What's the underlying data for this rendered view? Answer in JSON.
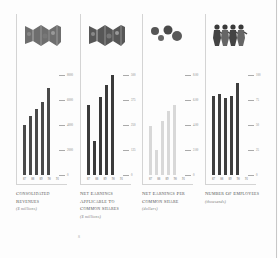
{
  "chart_data": [
    {
      "type": "bar",
      "title": "Consolidated revenues",
      "ylabel": "($ millions)",
      "categories": [
        "'87",
        "'88",
        "'89",
        "'90",
        "'91"
      ],
      "values": [
        4000,
        4700,
        5300,
        5850,
        6950
      ],
      "yticks": [
        0,
        2000,
        4000,
        6000,
        8000
      ],
      "ylim": [
        0,
        8000
      ],
      "bar_color": "#4a4a4a",
      "icon": "folded-map-icon"
    },
    {
      "type": "bar",
      "title": "Net earnings applicable to common shares",
      "ylabel": "($ millions)",
      "categories": [
        "'87",
        "'88",
        "'89",
        "'90",
        "'91"
      ],
      "values": [
        350,
        170,
        390,
        450,
        520
      ],
      "yticks": [
        0,
        125,
        250,
        375,
        500
      ],
      "ylim": [
        0,
        500
      ],
      "bar_color": "#3a3a3a",
      "icon": "folded-map-icon"
    },
    {
      "type": "bar",
      "title": "Net earnings per common share",
      "ylabel": "(dollars)",
      "categories": [
        "'87",
        "'88",
        "'89",
        "'90",
        "'91"
      ],
      "values": [
        3.9,
        2.0,
        4.3,
        5.1,
        5.6
      ],
      "yticks": [
        0,
        2,
        4,
        6,
        8
      ],
      "ylim": [
        0,
        8
      ],
      "bar_color": "#d8d8d8",
      "icon": "coins-icon"
    },
    {
      "type": "bar",
      "title": "Number of employees",
      "ylabel": "(thousands)",
      "categories": [
        "'87",
        "'88",
        "'89",
        "'90",
        "'91"
      ],
      "values": [
        79,
        81,
        77,
        79,
        92
      ],
      "yticks": [
        0,
        25,
        50,
        75,
        100
      ],
      "ylim": [
        0,
        100
      ],
      "bar_color": "#3e3e3e",
      "icon": "paper-doll-people-icon"
    }
  ],
  "panels": [
    {
      "title": "Consolidated revenues",
      "unit": "($ millions)",
      "ticks": [
        "0",
        "2000",
        "4000",
        "6000",
        "8000"
      ]
    },
    {
      "title": "Net earnings applicable to common shares",
      "unit": "($ millions)",
      "ticks": [
        "0",
        "125",
        "250",
        "375",
        "500"
      ]
    },
    {
      "title": "Net earnings per common share",
      "unit": "(dollars)",
      "ticks": [
        "0",
        "2.00",
        "4.00",
        "6.00",
        "8.00"
      ]
    },
    {
      "title": "Number of employees",
      "unit": "(thousands)",
      "ticks": [
        "0",
        "25",
        "50",
        "75",
        "100"
      ]
    }
  ],
  "years": [
    "87",
    "88",
    "89",
    "90",
    "91"
  ],
  "page_mark": "8"
}
